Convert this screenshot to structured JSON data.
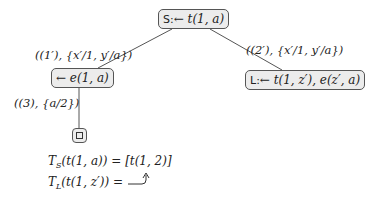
{
  "tree": {
    "root": {
      "tag": "S:",
      "goal": "← t(1, a)"
    },
    "left_child": {
      "goal": "← e(1, a)"
    },
    "right_child": {
      "tag": "L:",
      "goal": "← t(1, z′), e(z′, a)"
    },
    "leaf": {
      "symbol": "□"
    },
    "edges": [
      {
        "from": "root",
        "to": "left_child",
        "label": "((1′), {x′/1, y′/a})"
      },
      {
        "from": "root",
        "to": "right_child",
        "label": "((2′), {x′/1, y′/a})"
      },
      {
        "from": "left_child",
        "to": "leaf",
        "label": "((3), {a/2})"
      }
    ]
  },
  "equations": [
    {
      "lhs_symbol": "T",
      "lhs_sub": "S",
      "lhs_arg": "(t(1, a)) =",
      "rhs": "[t(1, 2)]"
    },
    {
      "lhs_symbol": "T",
      "lhs_sub": "L",
      "lhs_arg": "(t(1, z′)) =",
      "rhs_icon": "hook-arrow"
    }
  ]
}
